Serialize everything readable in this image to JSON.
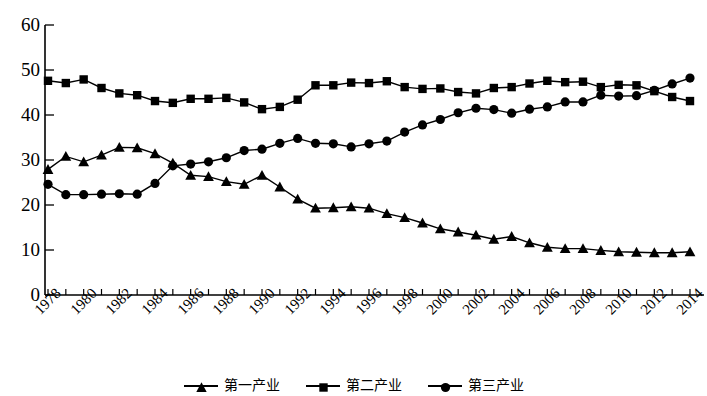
{
  "chart_data": {
    "type": "line",
    "title": "",
    "subtitle": "",
    "xlabel": "",
    "ylabel": "",
    "grid": false,
    "legend_position": "bottom",
    "xlim": [
      1978,
      2014
    ],
    "ylim": [
      0,
      60
    ],
    "ytick_values": [
      0,
      10,
      20,
      30,
      40,
      50,
      60
    ],
    "ytick_labels": [
      "0",
      "10",
      "20",
      "30",
      "40",
      "50",
      "60"
    ],
    "x": [
      1978,
      1979,
      1980,
      1981,
      1982,
      1983,
      1984,
      1985,
      1986,
      1987,
      1988,
      1989,
      1990,
      1991,
      1992,
      1993,
      1994,
      1995,
      1996,
      1997,
      1998,
      1999,
      2000,
      2001,
      2002,
      2003,
      2004,
      2005,
      2006,
      2007,
      2008,
      2009,
      2010,
      2011,
      2012,
      2013,
      2014
    ],
    "xtick_labels": [
      "1978",
      "1980",
      "1982",
      "1984",
      "1986",
      "1988",
      "1990",
      "1992",
      "1994",
      "1996",
      "1998",
      "2000",
      "2002",
      "2004",
      "2006",
      "2008",
      "2010",
      "2012",
      "2014"
    ],
    "series": [
      {
        "name": "第一产业",
        "marker": "triangle",
        "color": "#000000",
        "values": [
          27.9,
          30.8,
          29.6,
          31.1,
          32.8,
          32.7,
          31.4,
          29.3,
          26.6,
          26.3,
          25.2,
          24.6,
          26.6,
          24.0,
          21.3,
          19.3,
          19.4,
          19.6,
          19.3,
          18.1,
          17.2,
          16.0,
          14.7,
          14.0,
          13.3,
          12.4,
          13.0,
          11.6,
          10.6,
          10.3,
          10.3,
          9.9,
          9.6,
          9.5,
          9.4,
          9.4,
          9.6
        ]
      },
      {
        "name": "第二产业",
        "marker": "square",
        "color": "#000000",
        "values": [
          47.6,
          47.1,
          47.9,
          46.0,
          44.8,
          44.4,
          43.1,
          42.7,
          43.6,
          43.6,
          43.8,
          42.8,
          41.3,
          41.8,
          43.4,
          46.6,
          46.6,
          47.2,
          47.1,
          47.5,
          46.2,
          45.8,
          45.9,
          45.1,
          44.8,
          46.0,
          46.2,
          47.0,
          47.6,
          47.3,
          47.4,
          46.2,
          46.7,
          46.6,
          45.3,
          44.0,
          43.1
        ]
      },
      {
        "name": "第三产业",
        "marker": "circle",
        "color": "#000000",
        "values": [
          24.6,
          22.3,
          22.3,
          22.4,
          22.5,
          22.4,
          24.8,
          28.7,
          29.1,
          29.6,
          30.5,
          32.1,
          32.4,
          33.7,
          34.8,
          33.7,
          33.6,
          32.9,
          33.6,
          34.2,
          36.2,
          37.8,
          39.0,
          40.5,
          41.5,
          41.2,
          40.4,
          41.3,
          41.8,
          42.9,
          42.9,
          44.4,
          44.2,
          44.3,
          45.5,
          46.9,
          48.2
        ]
      }
    ]
  },
  "axes": {
    "y_tick_labels": [
      "60",
      "50",
      "40",
      "30",
      "20",
      "10",
      "0"
    ],
    "x_tick_labels": [
      "1978",
      "1980",
      "1982",
      "1984",
      "1986",
      "1988",
      "1990",
      "1992",
      "1994",
      "1996",
      "1998",
      "2000",
      "2002",
      "2004",
      "2006",
      "2008",
      "2010",
      "2012",
      "2014"
    ]
  },
  "legend": {
    "items": [
      {
        "label": "第一产业",
        "marker": "triangle-marker"
      },
      {
        "label": "第二产业",
        "marker": "square-marker"
      },
      {
        "label": "第三产业",
        "marker": "circle-marker"
      }
    ]
  }
}
